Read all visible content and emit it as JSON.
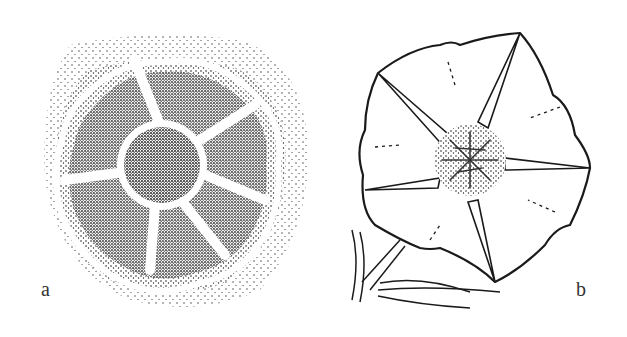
{
  "figure": {
    "panels": [
      {
        "id": "a",
        "label": "a",
        "description": "stippled flower cross-section with central disc and seven petal ridges"
      },
      {
        "id": "b",
        "label": "b",
        "description": "line drawing of open star-shaped flower with stamens at center and stem below"
      }
    ],
    "colors": {
      "ink": "#1a1a1a",
      "paper": "#ffffff"
    }
  }
}
